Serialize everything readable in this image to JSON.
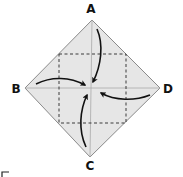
{
  "diagram": {
    "labels": {
      "top": "A",
      "left": "B",
      "bottom": "C",
      "right": "D"
    },
    "colors": {
      "paper_fill": "#e6e6e6",
      "paper_edge": "#8a8a8a",
      "dashed_line": "#3a3a3a",
      "crease_line": "#a8a8a8",
      "arrow": "#111111",
      "label": "#111111"
    },
    "arrows": [
      {
        "from": "A",
        "to": "center"
      },
      {
        "from": "B",
        "to": "center"
      },
      {
        "from": "C",
        "to": "center"
      },
      {
        "from": "D",
        "to": "center"
      }
    ]
  }
}
